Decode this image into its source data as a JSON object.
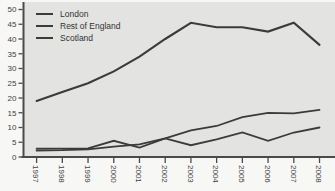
{
  "chart_data": {
    "type": "line",
    "title": "",
    "xlabel": "",
    "ylabel": "",
    "x": [
      "1997",
      "1998",
      "1999",
      "2000",
      "2001",
      "2002",
      "2003",
      "2004",
      "2005",
      "2006",
      "2007",
      "2008"
    ],
    "series": [
      {
        "name": "London",
        "values": [
          19,
          22,
          25,
          29,
          34,
          40,
          45.5,
          44,
          44,
          42.5,
          45.5,
          38
        ]
      },
      {
        "name": "Rest of England",
        "values": [
          2.2,
          2.3,
          2.6,
          3.5,
          4.3,
          6.3,
          9,
          10.5,
          13.5,
          15,
          14.8,
          16
        ]
      },
      {
        "name": "Scotland",
        "values": [
          2.8,
          2.8,
          2.9,
          5.5,
          3.2,
          6.3,
          4,
          6,
          8.3,
          5.5,
          8.3,
          10
        ]
      }
    ],
    "ylim": [
      0,
      50
    ],
    "y_ticks": [
      0,
      5,
      10,
      15,
      20,
      25,
      30,
      35,
      40,
      45,
      50
    ],
    "grid": false,
    "legend_position": "top-left",
    "line_color": "#3b3b3b",
    "axis_color": "#4a4a4a",
    "tick_label_color": "#3f3f3f",
    "plot_bg": "#e3e3e2"
  }
}
